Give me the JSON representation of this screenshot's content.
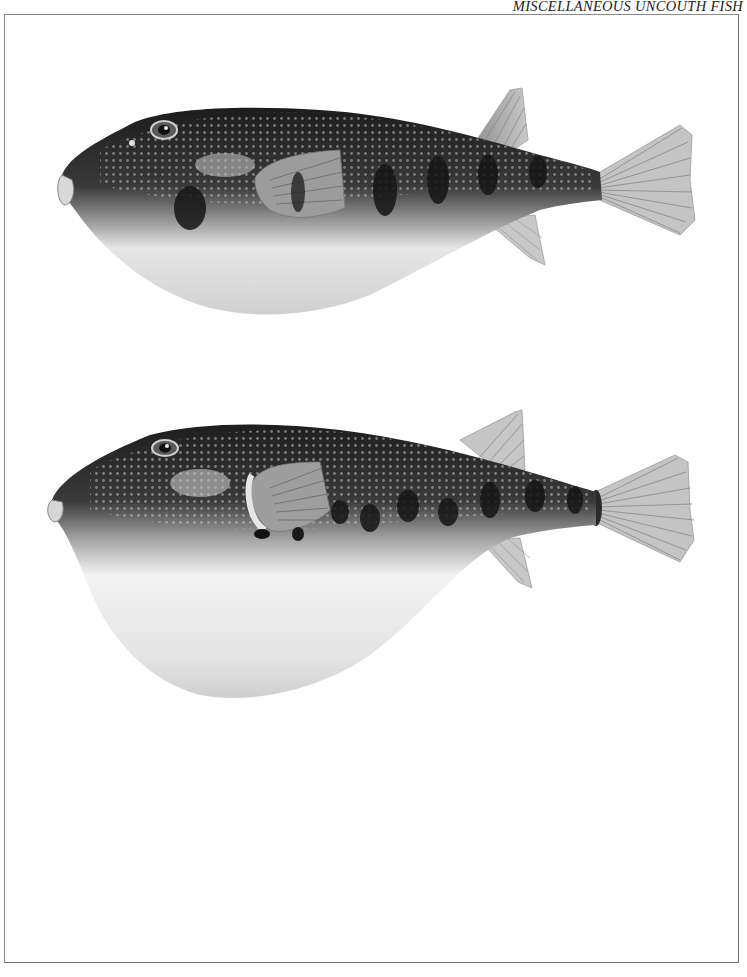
{
  "page": {
    "running_head": "MISCELLANEOUS UNCOUTH FISH"
  },
  "plate": {
    "figures": [
      {
        "id": "figure-1",
        "subject": "pufferfish",
        "state": "deflated",
        "orientation": "left-facing"
      },
      {
        "id": "figure-2",
        "subject": "pufferfish",
        "state": "inflated",
        "orientation": "left-facing"
      }
    ]
  },
  "colors": {
    "background": "#ffffff",
    "frame": "#7a7a7a",
    "dorsal_dark": "#1e1e1e",
    "belly_light": "#f4f4f4",
    "fin": "#b8b8b8"
  }
}
